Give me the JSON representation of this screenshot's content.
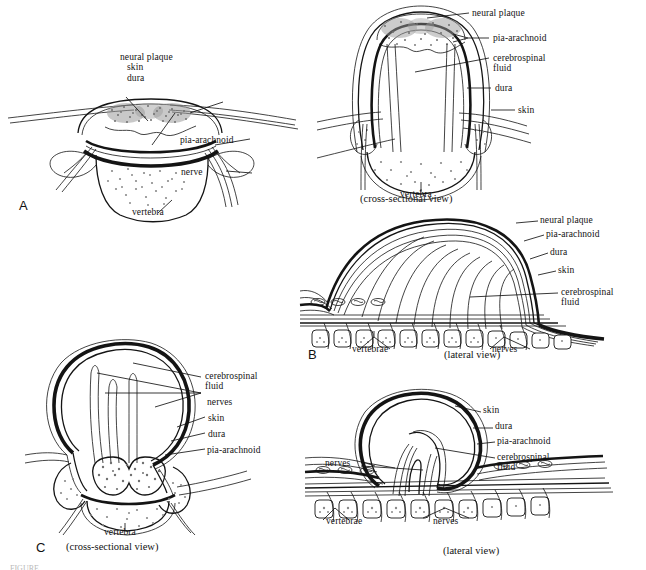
{
  "figure": {
    "background_color": "#ffffff",
    "ink_color": "#141414",
    "caption_fragment": "FIGURE",
    "panels": [
      {
        "letter": "A",
        "view_caption": "",
        "labels": [
          "neural plaque",
          "skin",
          "dura",
          "pia-arachnoid",
          "nerve",
          "vertebra"
        ]
      },
      {
        "letter": "B",
        "view_caption_cross": "(cross-sectional view)",
        "view_caption_lateral": "(lateral view)",
        "labels_cross": [
          "neural plaque",
          "pia-arachnoid",
          "cerebrospinal",
          "fluid",
          "dura",
          "skin",
          "vertebra"
        ],
        "labels_lateral": [
          "neural plaque",
          "pia-arachnoid",
          "dura",
          "skin",
          "cerebrospinal",
          "fluid",
          "vertebrae",
          "nerves"
        ],
        "vertebrae_count_lateral": 12
      },
      {
        "letter": "C",
        "view_caption_cross": "(cross-sectional view)",
        "view_caption_lateral": "(lateral view)",
        "labels_cross": [
          "cerebrospinal",
          "fluid",
          "nerves",
          "skin",
          "dura",
          "pia-arachnoid",
          "vertebra"
        ],
        "labels_lateral": [
          "skin",
          "dura",
          "pia-arachnoid",
          "cerebrospinal",
          "fluid",
          "nerves",
          "vertebrae",
          "nerves"
        ],
        "vertebrae_count_lateral": 10
      }
    ]
  },
  "panelA": {
    "letter": "A",
    "neural_plaque": "neural plaque",
    "skin": "skin",
    "dura": "dura",
    "pia_arachnoid": "pia-arachnoid",
    "nerve": "nerve",
    "vertebra": "vertebra"
  },
  "panelB_cross": {
    "neural_plaque": "neural plaque",
    "pia_arachnoid": "pia-arachnoid",
    "csf_line1": "cerebrospinal",
    "csf_line2": "fluid",
    "dura": "dura",
    "skin": "skin",
    "vertebra": "vertebra",
    "view": "(cross-sectional view)"
  },
  "panelB_lateral": {
    "letter": "B",
    "neural_plaque": "neural plaque",
    "pia_arachnoid": "pia-arachnoid",
    "dura": "dura",
    "skin": "skin",
    "csf_line1": "cerebrospinal",
    "csf_line2": "fluid",
    "vertebrae": "vertebrae",
    "nerves": "nerves",
    "view": "(lateral view)"
  },
  "panelC_cross": {
    "letter": "C",
    "csf_line1": "cerebrospinal",
    "csf_line2": "fluid",
    "nerves": "nerves",
    "skin": "skin",
    "dura": "dura",
    "pia_arachnoid": "pia-arachnoid",
    "vertebra": "vertebra",
    "view": "(cross-sectional view)"
  },
  "panelC_lateral": {
    "skin": "skin",
    "dura": "dura",
    "pia_arachnoid": "pia-arachnoid",
    "csf_line1": "cerebrospinal",
    "csf_line2": "fluid",
    "nerves_left": "nerves",
    "vertebrae": "vertebrae",
    "nerves_right": "nerves",
    "view": "(lateral view)"
  }
}
